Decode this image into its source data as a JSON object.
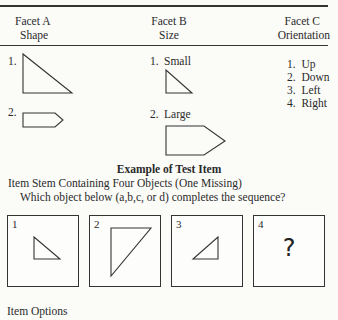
{
  "facets": {
    "a": {
      "title": "Facet A",
      "subtitle": "Shape",
      "items": [
        {
          "num": "1.",
          "shape": "right-triangle"
        },
        {
          "num": "2.",
          "shape": "pentagon-arrow"
        }
      ]
    },
    "b": {
      "title": "Facet B",
      "subtitle": "Size",
      "items": [
        {
          "num": "1.",
          "label": "Small",
          "shape": "small-right-triangle"
        },
        {
          "num": "2.",
          "label": "Large",
          "shape": "large-pentagon-arrow"
        }
      ]
    },
    "c": {
      "title": "Facet C",
      "subtitle": "Orientation",
      "items": [
        {
          "num": "1.",
          "label": "Up"
        },
        {
          "num": "2.",
          "label": "Down"
        },
        {
          "num": "3.",
          "label": "Left"
        },
        {
          "num": "4.",
          "label": "Right"
        }
      ]
    }
  },
  "example": {
    "heading": "Example of Test Item",
    "stem": "Item Stem Containing Four Objects (One Missing)",
    "question": "Which object below (a,b,c, or d) completes the sequence?",
    "boxes": [
      {
        "num": "1",
        "content": "small-triangle"
      },
      {
        "num": "2",
        "content": "large-triangle"
      },
      {
        "num": "3",
        "content": "small-triangle-flipped"
      },
      {
        "num": "4",
        "content": "?"
      }
    ]
  },
  "options_label": "Item Options"
}
